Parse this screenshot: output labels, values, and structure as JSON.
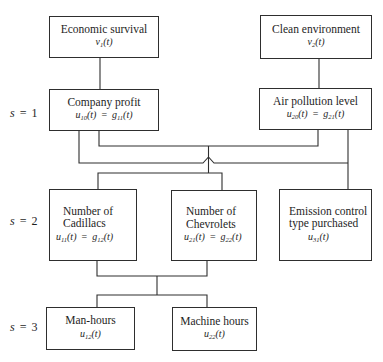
{
  "diagram": {
    "levels": [
      {
        "var": "s",
        "eq": "=",
        "value": "1"
      },
      {
        "var": "s",
        "eq": "=",
        "value": "2"
      },
      {
        "var": "s",
        "eq": "=",
        "value": "3"
      }
    ],
    "nodes": [
      {
        "id": "economic_survival",
        "lines": [
          "Economic survival"
        ],
        "formula": {
          "lhs": {
            "sym": "v",
            "sub": "1",
            "arg": "(t)"
          }
        }
      },
      {
        "id": "clean_environment",
        "lines": [
          "Clean environment"
        ],
        "formula": {
          "lhs": {
            "sym": "v",
            "sub": "2",
            "arg": "(t)"
          }
        }
      },
      {
        "id": "company_profit",
        "lines": [
          "Company profit"
        ],
        "formula": {
          "lhs": {
            "sym": "u",
            "sub": "10",
            "arg": "(t)"
          },
          "eq": "=",
          "rhs": {
            "sym": "g",
            "sub": "11",
            "arg": "(t)"
          }
        }
      },
      {
        "id": "air_pollution_level",
        "lines": [
          "Air pollution level"
        ],
        "formula": {
          "lhs": {
            "sym": "u",
            "sub": "20",
            "arg": "(t)"
          },
          "eq": "=",
          "rhs": {
            "sym": "g",
            "sub": "21",
            "arg": "(t)"
          }
        }
      },
      {
        "id": "number_of_cadillacs",
        "lines": [
          "Number of",
          "Cadillacs"
        ],
        "formula": {
          "lhs": {
            "sym": "u",
            "sub": "11",
            "arg": "(t)"
          },
          "eq": "=",
          "rhs": {
            "sym": "g",
            "sub": "12",
            "arg": "(t)"
          }
        }
      },
      {
        "id": "number_of_chevrolets",
        "lines": [
          "Number of",
          "Chevrolets"
        ],
        "formula": {
          "lhs": {
            "sym": "u",
            "sub": "21",
            "arg": "(t)"
          },
          "eq": "=",
          "rhs": {
            "sym": "g",
            "sub": "22",
            "arg": "(t)"
          }
        }
      },
      {
        "id": "emission_control_type",
        "lines": [
          "Emission control",
          "type purchased"
        ],
        "formula": {
          "lhs": {
            "sym": "u",
            "sub": "31",
            "arg": "(t)"
          }
        }
      },
      {
        "id": "man_hours",
        "lines": [
          "Man-hours"
        ],
        "formula": {
          "lhs": {
            "sym": "u",
            "sub": "12",
            "arg": "(t)"
          }
        }
      },
      {
        "id": "machine_hours",
        "lines": [
          "Machine hours"
        ],
        "formula": {
          "lhs": {
            "sym": "u",
            "sub": "22",
            "arg": "(t)"
          }
        }
      }
    ],
    "edges": [
      {
        "from": "economic_survival",
        "to": "company_profit"
      },
      {
        "from": "clean_environment",
        "to": "air_pollution_level"
      },
      {
        "from": "company_profit",
        "to": "number_of_cadillacs"
      },
      {
        "from": "company_profit",
        "to": "number_of_chevrolets"
      },
      {
        "from": "air_pollution_level",
        "to": "number_of_cadillacs"
      },
      {
        "from": "air_pollution_level",
        "to": "number_of_chevrolets"
      },
      {
        "from": "company_profit",
        "to": "emission_control_type"
      },
      {
        "from": "air_pollution_level",
        "to": "emission_control_type"
      },
      {
        "from": "number_of_cadillacs",
        "to": "man_hours"
      },
      {
        "from": "number_of_cadillacs",
        "to": "machine_hours"
      },
      {
        "from": "number_of_chevrolets",
        "to": "man_hours"
      },
      {
        "from": "number_of_chevrolets",
        "to": "machine_hours"
      }
    ],
    "colors": {
      "line": "#2e2e2e",
      "background": "#ffffff",
      "text": "#1e1e1e"
    }
  }
}
